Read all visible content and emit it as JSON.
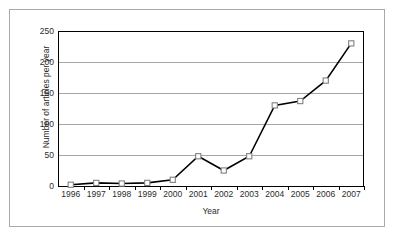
{
  "chart_data": {
    "type": "line",
    "title": "",
    "subtitle": "",
    "xlabel": "Year",
    "ylabel": "Number of articles per year",
    "categories": [
      "1996",
      "1997",
      "1998",
      "1999",
      "2000",
      "2001",
      "2002",
      "2003",
      "2004",
      "2005",
      "2006",
      "2007"
    ],
    "values": [
      2,
      5,
      4,
      5,
      10,
      48,
      25,
      48,
      130,
      137,
      170,
      230
    ],
    "series": [
      {
        "name": "Articles per year",
        "values": [
          2,
          5,
          4,
          5,
          10,
          48,
          25,
          48,
          130,
          137,
          170,
          230
        ]
      }
    ],
    "ylim": [
      0,
      250
    ],
    "yticks": [
      0,
      50,
      100,
      150,
      200,
      250
    ],
    "ytick_labels": [
      "0",
      "50",
      "100",
      "150",
      "200",
      "250"
    ],
    "xtick_labels": [
      "1996",
      "1997",
      "1998",
      "1999",
      "2000",
      "2001",
      "2002",
      "2003",
      "2004",
      "2005",
      "2006",
      "2007"
    ],
    "grid": "horizontal",
    "legend": "none",
    "marker": "open-square",
    "line_color": "#000000",
    "marker_edge_color": "#808080",
    "marker_face_color": "#ffffff",
    "grid_color": "#a6a6a6",
    "axis_color": "#000000",
    "background_color": "#ffffff",
    "frame_color": "#a9a9a9"
  }
}
